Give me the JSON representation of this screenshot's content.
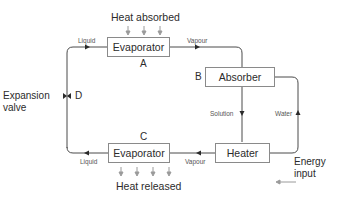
{
  "diagram": {
    "type": "absorption refrigeration cycle",
    "top": {
      "heat_label": "Heat absorbed",
      "evaporator": {
        "label": "Evaporator",
        "letter": "A"
      },
      "inlet_flow": "Liquid",
      "outlet_flow": "Vapour"
    },
    "absorber": {
      "label": "Absorber",
      "letter": "B"
    },
    "heater": {
      "label": "Heater"
    },
    "connections": {
      "absorber_to_heater": "Solution",
      "heater_to_absorber": "Water"
    },
    "energy_input": {
      "line1": "Energy",
      "line2": "input"
    },
    "bottom": {
      "evaporator": {
        "label": "Evaporator",
        "letter": "C"
      },
      "inlet_flow": "Vapour",
      "outlet_flow": "Liquid",
      "heat_label": "Heat released"
    },
    "valve": {
      "line1": "Expansion",
      "line2": "valve",
      "letter": "D"
    },
    "colors": {
      "line": "#4a4a4a",
      "box_border": "#8a8a8a",
      "arrow_gray": "#9a9a9a"
    }
  }
}
